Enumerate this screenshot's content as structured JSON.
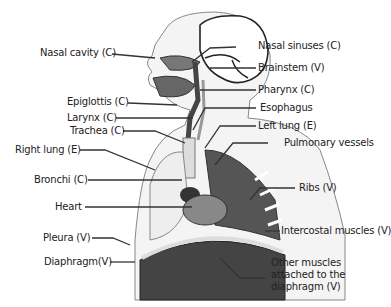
{
  "labels": {
    "nasal_cavity": "Nasal cavity (C)",
    "nasal_sinuses": "Nasal sinuses (C)",
    "brainstem": "Brainstem (V)",
    "pharynx": "Pharynx (C)",
    "epiglottis": "Epiglottis (C)",
    "esophagus": "Esophagus",
    "larynx": "Larynx (C)",
    "left_lung": "Left lung (E)",
    "trachea": "Trachea (C)",
    "pulmonary_vessels": "Pulmonary vessels",
    "right_lung": "Right lung (E)",
    "bronchi": "Bronchi (C)",
    "ribs": "Ribs (V)",
    "heart": "Heart",
    "intercostal": "Intercostal muscles (V)",
    "pleura": "Pleura (V)",
    "diaphragm": "Diaphragm(V)",
    "other_muscles": "Other muscles attached to the diaphragm (V)"
  },
  "colors": {
    "line": "#333333",
    "body": "#f3f3f3",
    "organ_dark": "#555555"
  }
}
